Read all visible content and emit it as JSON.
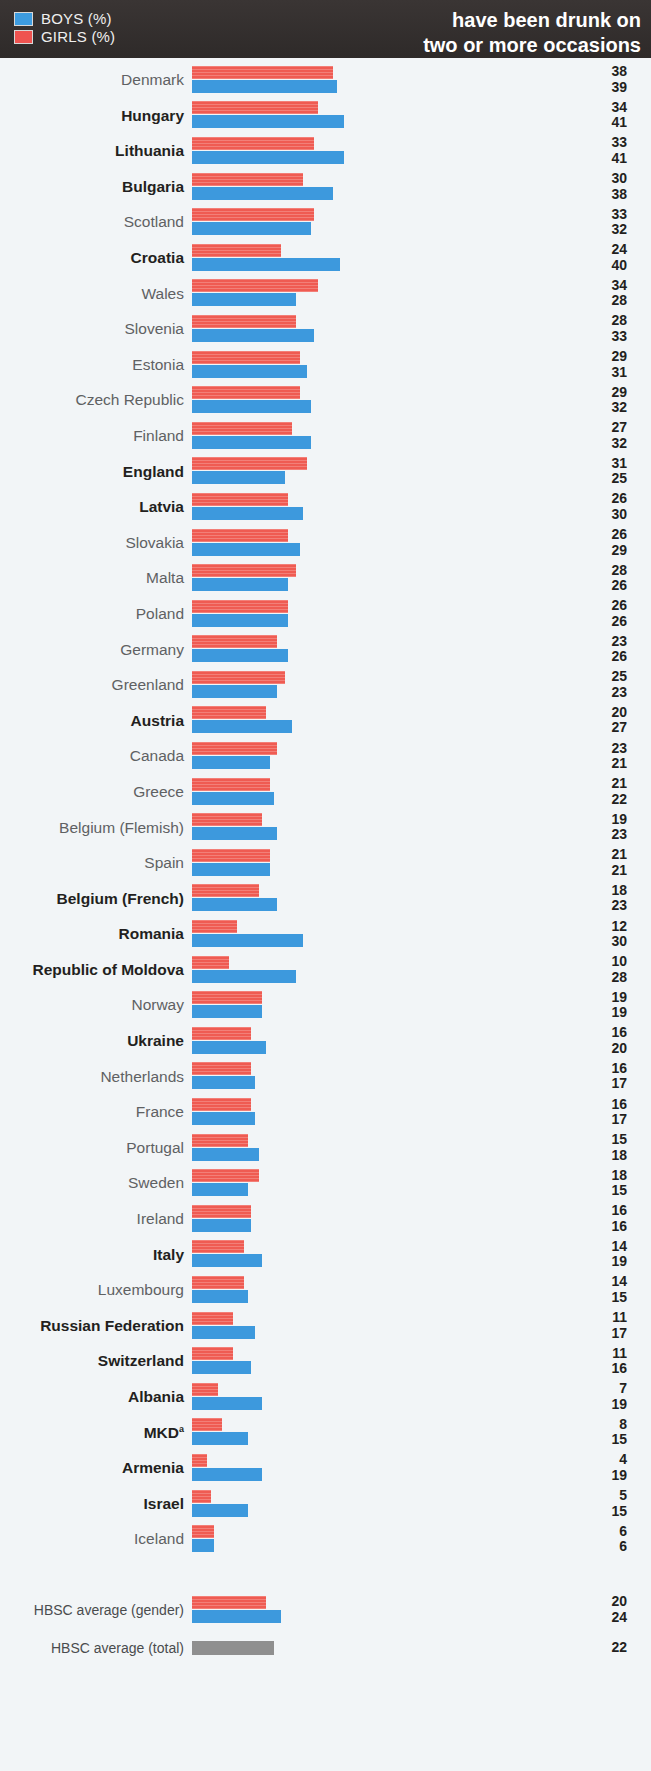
{
  "header": {
    "title_line1": "have been drunk on",
    "title_line2": "two or more occasions",
    "legend": [
      {
        "key": "boys",
        "label": "BOYS (%)",
        "color": "#3d99dd"
      },
      {
        "key": "girls",
        "label": "GIRLS (%)",
        "color": "#ef5b52"
      }
    ],
    "background_color": "#332f2e"
  },
  "chart_data": {
    "type": "bar",
    "orientation": "horizontal",
    "title": "have been drunk on two or more occasions",
    "xlabel": "",
    "ylabel": "",
    "xlim": [
      0,
      45
    ],
    "grid": false,
    "legend_position": "top-left",
    "value_label_order": [
      "girls",
      "boys"
    ],
    "categories": [
      "Denmark",
      "Hungary",
      "Lithuania",
      "Bulgaria",
      "Scotland",
      "Croatia",
      "Wales",
      "Slovenia",
      "Estonia",
      "Czech Republic",
      "Finland",
      "England",
      "Latvia",
      "Slovakia",
      "Malta",
      "Poland",
      "Germany",
      "Greenland",
      "Austria",
      "Canada",
      "Greece",
      "Belgium (Flemish)",
      "Spain",
      "Belgium (French)",
      "Romania",
      "Republic of Moldova",
      "Norway",
      "Ukraine",
      "Netherlands",
      "France",
      "Portugal",
      "Sweden",
      "Ireland",
      "Italy",
      "Luxembourg",
      "Russian Federation",
      "Switzerland",
      "Albania",
      "MKD",
      "Armenia",
      "Israel",
      "Iceland"
    ],
    "series": [
      {
        "name": "GIRLS (%)",
        "color": "#ef5b52",
        "values": [
          38,
          34,
          33,
          30,
          33,
          24,
          34,
          28,
          29,
          29,
          27,
          31,
          26,
          26,
          28,
          26,
          23,
          25,
          20,
          23,
          21,
          19,
          21,
          18,
          12,
          10,
          19,
          16,
          16,
          16,
          15,
          18,
          16,
          14,
          14,
          11,
          11,
          7,
          8,
          4,
          5,
          6
        ]
      },
      {
        "name": "BOYS (%)",
        "color": "#3d99dd",
        "values": [
          39,
          41,
          41,
          38,
          32,
          40,
          28,
          33,
          31,
          32,
          32,
          25,
          30,
          29,
          26,
          26,
          26,
          23,
          27,
          21,
          22,
          23,
          21,
          23,
          30,
          28,
          19,
          20,
          17,
          17,
          18,
          15,
          16,
          19,
          15,
          17,
          16,
          19,
          15,
          19,
          15,
          6
        ]
      }
    ],
    "averages": [
      {
        "label": "HBSC average (gender)",
        "girls": 20,
        "boys": 24
      },
      {
        "label": "HBSC average (total)",
        "total": 22,
        "color": "#8f8f8f"
      }
    ]
  },
  "rows": [
    {
      "label": "Denmark",
      "bold": false,
      "girls": 38,
      "boys": 39
    },
    {
      "label": "Hungary",
      "bold": true,
      "girls": 34,
      "boys": 41
    },
    {
      "label": "Lithuania",
      "bold": true,
      "girls": 33,
      "boys": 41
    },
    {
      "label": "Bulgaria",
      "bold": true,
      "girls": 30,
      "boys": 38
    },
    {
      "label": "Scotland",
      "bold": false,
      "girls": 33,
      "boys": 32
    },
    {
      "label": "Croatia",
      "bold": true,
      "girls": 24,
      "boys": 40
    },
    {
      "label": "Wales",
      "bold": false,
      "girls": 34,
      "boys": 28
    },
    {
      "label": "Slovenia",
      "bold": false,
      "girls": 28,
      "boys": 33
    },
    {
      "label": "Estonia",
      "bold": false,
      "girls": 29,
      "boys": 31
    },
    {
      "label": "Czech Republic",
      "bold": false,
      "girls": 29,
      "boys": 32
    },
    {
      "label": "Finland",
      "bold": false,
      "girls": 27,
      "boys": 32
    },
    {
      "label": "England",
      "bold": true,
      "girls": 31,
      "boys": 25
    },
    {
      "label": "Latvia",
      "bold": true,
      "girls": 26,
      "boys": 30
    },
    {
      "label": "Slovakia",
      "bold": false,
      "girls": 26,
      "boys": 29
    },
    {
      "label": "Malta",
      "bold": false,
      "girls": 28,
      "boys": 26
    },
    {
      "label": "Poland",
      "bold": false,
      "girls": 26,
      "boys": 26
    },
    {
      "label": "Germany",
      "bold": false,
      "girls": 23,
      "boys": 26
    },
    {
      "label": "Greenland",
      "bold": false,
      "girls": 25,
      "boys": 23
    },
    {
      "label": "Austria",
      "bold": true,
      "girls": 20,
      "boys": 27
    },
    {
      "label": "Canada",
      "bold": false,
      "girls": 23,
      "boys": 21
    },
    {
      "label": "Greece",
      "bold": false,
      "girls": 21,
      "boys": 22
    },
    {
      "label": "Belgium (Flemish)",
      "bold": false,
      "girls": 19,
      "boys": 23
    },
    {
      "label": "Spain",
      "bold": false,
      "girls": 21,
      "boys": 21
    },
    {
      "label": "Belgium (French)",
      "bold": true,
      "girls": 18,
      "boys": 23
    },
    {
      "label": "Romania",
      "bold": true,
      "girls": 12,
      "boys": 30
    },
    {
      "label": "Republic of Moldova",
      "bold": true,
      "girls": 10,
      "boys": 28
    },
    {
      "label": "Norway",
      "bold": false,
      "girls": 19,
      "boys": 19
    },
    {
      "label": "Ukraine",
      "bold": true,
      "girls": 16,
      "boys": 20
    },
    {
      "label": "Netherlands",
      "bold": false,
      "girls": 16,
      "boys": 17
    },
    {
      "label": "France",
      "bold": false,
      "girls": 16,
      "boys": 17
    },
    {
      "label": "Portugal",
      "bold": false,
      "girls": 15,
      "boys": 18
    },
    {
      "label": "Sweden",
      "bold": false,
      "girls": 18,
      "boys": 15
    },
    {
      "label": "Ireland",
      "bold": false,
      "girls": 16,
      "boys": 16
    },
    {
      "label": "Italy",
      "bold": true,
      "girls": 14,
      "boys": 19
    },
    {
      "label": "Luxembourg",
      "bold": false,
      "girls": 14,
      "boys": 15
    },
    {
      "label": "Russian Federation",
      "bold": true,
      "girls": 11,
      "boys": 17
    },
    {
      "label": "Switzerland",
      "bold": true,
      "girls": 11,
      "boys": 16
    },
    {
      "label": "Albania",
      "bold": true,
      "girls": 7,
      "boys": 19
    },
    {
      "label": "MKD",
      "sup": "a",
      "bold": true,
      "girls": 8,
      "boys": 15
    },
    {
      "label": "Armenia",
      "bold": true,
      "girls": 4,
      "boys": 19
    },
    {
      "label": "Israel",
      "bold": true,
      "girls": 5,
      "boys": 15
    },
    {
      "label": "Iceland",
      "bold": false,
      "girls": 6,
      "boys": 6
    }
  ],
  "footer_rows": [
    {
      "label": "HBSC average (gender)",
      "bold": false,
      "girls": 20,
      "boys": 24
    },
    {
      "label": "HBSC average (total)",
      "bold": false,
      "total": 22
    }
  ],
  "scale": {
    "px_per_unit": 3.71
  }
}
